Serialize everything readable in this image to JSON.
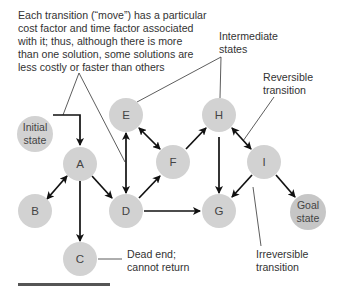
{
  "diagram": {
    "colors": {
      "node_fill": "#d2d2d2",
      "goal_fill": "#c6c6c6",
      "edge": "#111111",
      "text": "#333333"
    },
    "nodes": [
      {
        "id": "initial",
        "label_lines": [
          "Initial",
          "state"
        ],
        "x": 35,
        "y": 134,
        "r": 18
      },
      {
        "id": "A",
        "label": "A",
        "x": 80,
        "y": 164,
        "r": 17
      },
      {
        "id": "B",
        "label": "B",
        "x": 35,
        "y": 211,
        "r": 17
      },
      {
        "id": "C",
        "label": "C",
        "x": 80,
        "y": 259,
        "r": 17
      },
      {
        "id": "D",
        "label": "D",
        "x": 126,
        "y": 211,
        "r": 17
      },
      {
        "id": "E",
        "label": "E",
        "x": 126,
        "y": 115,
        "r": 17
      },
      {
        "id": "F",
        "label": "F",
        "x": 173,
        "y": 162,
        "r": 17
      },
      {
        "id": "G",
        "label": "G",
        "x": 219,
        "y": 211,
        "r": 17
      },
      {
        "id": "H",
        "label": "H",
        "x": 219,
        "y": 115,
        "r": 17
      },
      {
        "id": "I",
        "label": "I",
        "x": 264,
        "y": 162,
        "r": 17
      },
      {
        "id": "goal",
        "label_lines": [
          "Goal",
          "state"
        ],
        "x": 308,
        "y": 212,
        "r": 18
      }
    ],
    "edges": [
      {
        "from": "initial",
        "to": "A",
        "type": "irreversible",
        "path": "elbow"
      },
      {
        "from": "A",
        "to": "B",
        "type": "reversible"
      },
      {
        "from": "A",
        "to": "C",
        "type": "irreversible"
      },
      {
        "from": "A",
        "to": "D",
        "type": "irreversible"
      },
      {
        "from": "D",
        "to": "E",
        "type": "reversible"
      },
      {
        "from": "E",
        "to": "F",
        "type": "reversible"
      },
      {
        "from": "D",
        "to": "F",
        "type": "irreversible"
      },
      {
        "from": "D",
        "to": "G",
        "type": "irreversible"
      },
      {
        "from": "F",
        "to": "H",
        "type": "irreversible"
      },
      {
        "from": "H",
        "to": "G",
        "type": "irreversible"
      },
      {
        "from": "H",
        "to": "I",
        "type": "reversible"
      },
      {
        "from": "I",
        "to": "G",
        "type": "irreversible"
      },
      {
        "from": "I",
        "to": "goal",
        "type": "irreversible"
      }
    ],
    "annotations": {
      "cost_note": {
        "lines": [
          "Each transition (“move”) has a particular",
          "cost factor and time factor associated",
          "with it; thus, although there is more",
          "than one solution, some solutions are",
          "less costly or faster than others"
        ]
      },
      "intermediate": {
        "lines": [
          "Intermediate",
          "states"
        ]
      },
      "reversible": {
        "lines": [
          "Reversible",
          "transition"
        ]
      },
      "irreversible": {
        "lines": [
          "Irreversible",
          "transition"
        ]
      },
      "dead_end": {
        "lines": [
          "Dead end;",
          "cannot return"
        ]
      }
    }
  }
}
